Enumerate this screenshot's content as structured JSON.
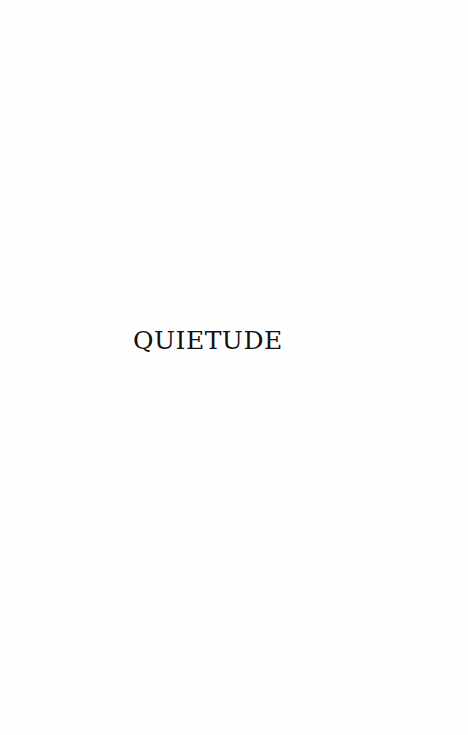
{
  "page": {
    "title": "QUIETUDE",
    "text_color": "#111111",
    "background_color": "#fefefe"
  }
}
